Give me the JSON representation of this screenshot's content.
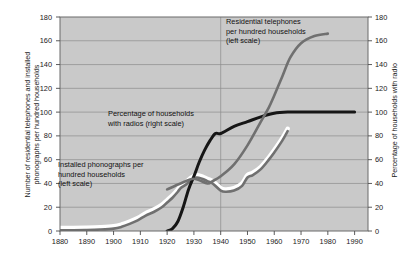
{
  "chart_data": {
    "type": "line",
    "title": "",
    "xlabel": "",
    "ylabel": "Number of residential telephones and installed phonographs per hundred households",
    "y2label": "Percentage of households with radio",
    "xlim": [
      1880,
      1995
    ],
    "ylim": [
      0,
      180
    ],
    "y2lim": [
      0,
      180
    ],
    "grid": true,
    "legend_position": "inline-annotations",
    "xticks": [
      "1880",
      "1890",
      "1900",
      "1910",
      "1920",
      "1930",
      "1940",
      "1950",
      "1960",
      "1970",
      "1980",
      "1990"
    ],
    "yticks_left": [
      "0",
      "20",
      "40",
      "60",
      "80",
      "100",
      "120",
      "140",
      "160",
      "180"
    ],
    "yticks_right": [
      "0",
      "20",
      "40",
      "60",
      "80",
      "100",
      "120",
      "140",
      "160",
      "180"
    ],
    "series": [
      {
        "name": "Installed phonographs per hundred households (left scale)",
        "axis": "left",
        "color": "#707070",
        "x": [
          1880,
          1885,
          1890,
          1895,
          1900,
          1903,
          1906,
          1909,
          1912,
          1915,
          1918,
          1920,
          1922,
          1924,
          1925,
          1927,
          1929,
          1931,
          1933,
          1935,
          1937,
          1940,
          1942,
          1945,
          1948,
          1950,
          1952,
          1955,
          1958,
          1960,
          1963,
          1965
        ],
        "values": [
          0.5,
          0.6,
          0.8,
          1.2,
          2,
          3.5,
          6,
          9,
          13,
          16,
          20,
          24,
          28,
          33,
          36,
          39,
          43,
          45,
          44,
          42,
          40,
          34,
          33,
          34,
          38,
          45,
          47,
          52,
          60,
          66,
          76,
          84
        ]
      },
      {
        "name": "Percentage of households with radios (right scale)",
        "axis": "right",
        "color": "#161616",
        "x": [
          1920,
          1922,
          1924,
          1926,
          1928,
          1930,
          1932,
          1934,
          1936,
          1938,
          1940,
          1945,
          1950,
          1955,
          1960,
          1965,
          1970,
          1980,
          1990
        ],
        "values": [
          0,
          2,
          8,
          20,
          35,
          46,
          58,
          68,
          76,
          82,
          82,
          88,
          92,
          96,
          99,
          100,
          100,
          100,
          100
        ]
      },
      {
        "name": "Residential telephones per hundred households (left scale)",
        "axis": "left",
        "color": "#707070",
        "x": [
          1920,
          1925,
          1930,
          1935,
          1937,
          1940,
          1945,
          1950,
          1955,
          1958,
          1960,
          1963,
          1966,
          1970,
          1975,
          1980
        ],
        "values": [
          35,
          40,
          44,
          40,
          42,
          46,
          56,
          72,
          92,
          104,
          114,
          130,
          146,
          158,
          164,
          166
        ]
      }
    ],
    "annotations": [
      {
        "name": "phonograph-label",
        "lines": [
          "Installed phonographs per",
          "hundred households",
          "(left scale)"
        ]
      },
      {
        "name": "radio-label",
        "lines": [
          "Percentage of households",
          "with radios (right scale)"
        ]
      },
      {
        "name": "telephone-label",
        "lines": [
          "Residential telephones",
          "per hundred households",
          "(left scale)"
        ]
      }
    ]
  },
  "axes": {
    "left_title_line1": "Number of residential telephones and installed",
    "left_title_line2": "phonographs per hundred households",
    "right_title": "Percentage of households with radio"
  }
}
